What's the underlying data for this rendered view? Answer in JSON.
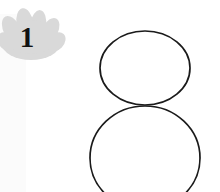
{
  "canvas": {
    "width": 220,
    "height": 192,
    "background_color": "#ffffff"
  },
  "left_margin_band": {
    "color": "#fbfbfb",
    "x": 0,
    "width": 26,
    "y": 14,
    "height": 178
  },
  "annotation_badge": {
    "icon_name": "flower-splat-badge",
    "label": "1",
    "fill_color": "#d9d9d9",
    "edge_color": "#d2d2d2",
    "center_x": 31,
    "center_y": 38,
    "width": 62,
    "height": 52,
    "petal_count": 6
  },
  "sketch": {
    "name": "snowman-outline-sketch",
    "stroke_color": "#1a1a1a",
    "fill_color": "#ffffff",
    "stroke_width": 1.7,
    "shapes": [
      {
        "shape_name": "head-circle",
        "type": "ellipse",
        "cx": 145,
        "cy": 68,
        "rx": 45,
        "ry": 37
      },
      {
        "shape_name": "body-circle",
        "type": "ellipse",
        "cx": 145,
        "cy": 158,
        "rx": 55,
        "ry": 52
      }
    ]
  }
}
